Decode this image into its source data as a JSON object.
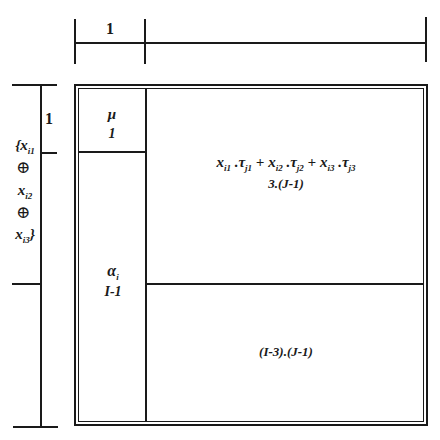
{
  "top_ruler": {
    "label": "1"
  },
  "left_ruler": {
    "label": "1",
    "factor_lines": [
      "{x",
      "⊕",
      "x",
      "⊕",
      "x"
    ],
    "factor_subs": [
      "i1",
      "",
      "i2",
      "",
      "i3"
    ],
    "factor_suffix": [
      "",
      "",
      "",
      "",
      "}"
    ]
  },
  "cells": {
    "mu": {
      "symbol": "μ",
      "dim": "1"
    },
    "alpha": {
      "symbol": "α",
      "sub": "i",
      "dim": "I-1"
    },
    "interaction": {
      "terms": [
        {
          "x": "x",
          "xsub": "i1",
          "t": "τ",
          "tsub": "j1"
        },
        {
          "x": "x",
          "xsub": "i2",
          "t": "τ",
          "tsub": "j2"
        },
        {
          "x": "x",
          "xsub": "i3",
          "t": "τ",
          "tsub": "j3"
        }
      ],
      "op_dot": ".",
      "op_plus": "+",
      "dim": "3.(J-1)"
    },
    "residual": {
      "dim": "(I-3).(J-1)"
    }
  }
}
